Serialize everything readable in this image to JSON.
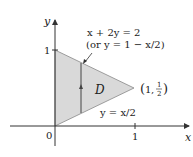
{
  "diagram": {
    "region_label": "D",
    "axis_x_label": "x",
    "axis_y_label": "y",
    "origin_label": "0",
    "x_tick_label": "1",
    "y_tick_label": "1",
    "upper_line_eq": "x + 2y = 2",
    "upper_line_alt": "(or y = 1 − x/2)",
    "lower_line_eq": "y = x/2",
    "vertex_label": "(1, ½)",
    "vertex_x": "1",
    "vertex_y_num": "1",
    "vertex_y_den": "2",
    "colors": {
      "region_fill": "#d9d9d9",
      "axis": "#333333",
      "text": "#222222"
    }
  }
}
